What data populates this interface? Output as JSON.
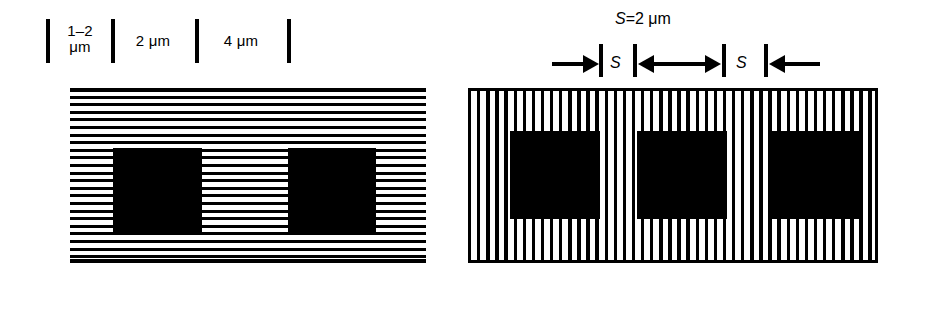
{
  "figure": {
    "ink_color": "#000000",
    "background_color": "#ffffff"
  },
  "left_panel": {
    "name": "horizontal-grating-panel",
    "orientation": "horizontal",
    "scale": {
      "ticks": [
        {
          "label": "",
          "x": 47
        },
        {
          "label": "1-2 μm",
          "x": 112
        },
        {
          "label": "2 μm",
          "x": 196
        },
        {
          "label": "4 μm",
          "x": 288
        }
      ],
      "segments": [
        {
          "id": "seg-1-2um",
          "line1": "1–2",
          "line2": "μm"
        },
        {
          "id": "seg-2um",
          "line1": "2 μm",
          "line2": ""
        },
        {
          "id": "seg-4um",
          "line1": "4 μm",
          "line2": ""
        }
      ]
    },
    "squares": [
      {
        "id": "left-square-1"
      },
      {
        "id": "left-square-2"
      }
    ]
  },
  "right_panel": {
    "name": "vertical-grating-panel",
    "orientation": "vertical",
    "dimension": {
      "title": "S=2 μm",
      "title_symbol": "S",
      "title_value": "=2 μm",
      "gap_labels": [
        "S",
        "S"
      ]
    },
    "squares": [
      {
        "id": "right-square-1"
      },
      {
        "id": "right-square-2"
      },
      {
        "id": "right-square-3"
      }
    ]
  }
}
